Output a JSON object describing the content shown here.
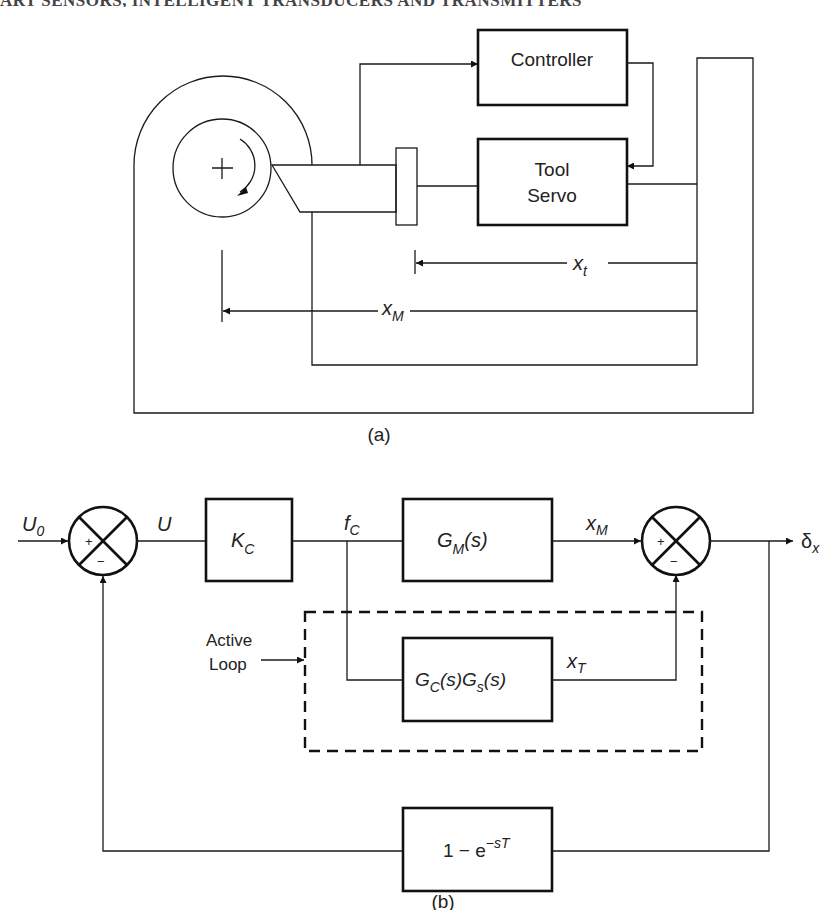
{
  "header": {
    "running_title": "ART SENSORS, INTELLIGENT TRANSDUCERS AND TRANSMITTERS",
    "page_number": ""
  },
  "figure_a": {
    "caption": "(a)",
    "blocks": {
      "controller": "Controller",
      "tool_servo_line1": "Tool",
      "tool_servo_line2": "Servo"
    },
    "dimensions": {
      "tool_position": {
        "symbol": "x",
        "subscript": "t"
      },
      "machine_position": {
        "symbol": "x",
        "subscript": "M"
      }
    },
    "parts": [
      "housing",
      "spindle",
      "rotation-arrow",
      "cutting-tool",
      "tool-holder",
      "machine-frame"
    ]
  },
  "figure_b": {
    "caption": "(b)",
    "input": {
      "symbol": "U",
      "subscript": "0"
    },
    "signal_u": "U",
    "blocks": {
      "gain": {
        "symbol": "K",
        "subscript": "C"
      },
      "machine": {
        "symbol": "G",
        "subscript": "M",
        "arg": "(s)"
      },
      "active": {
        "symbol1": "G",
        "sub1": "C",
        "arg1": "(s)",
        "symbol2": "G",
        "sub2": "s",
        "arg2": "(s)"
      },
      "delay": {
        "text": "1 − e",
        "exponent": "−sT"
      }
    },
    "signals": {
      "force": {
        "symbol": "f",
        "subscript": "C"
      },
      "x_m": {
        "symbol": "x",
        "subscript": "M"
      },
      "x_t": {
        "symbol": "x",
        "subscript": "T"
      },
      "output": {
        "symbol": "δ",
        "subscript": "x"
      }
    },
    "summing_junctions": [
      {
        "plus": "+",
        "minus": "−"
      },
      {
        "plus": "+",
        "minus": "−"
      }
    ],
    "annotation": {
      "line1": "Active",
      "line2": "Loop"
    }
  }
}
